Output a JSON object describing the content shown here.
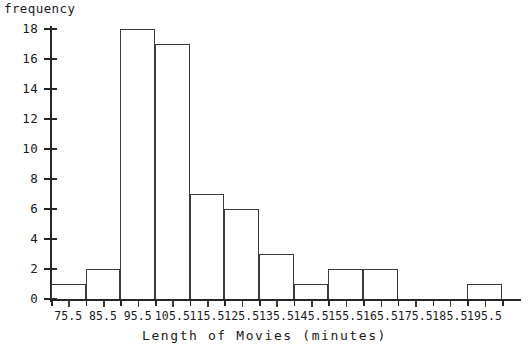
{
  "chart_data": {
    "type": "bar",
    "title": "",
    "xlabel": "Length of Movies (minutes)",
    "ylabel": "frequency",
    "categories": [
      "75.5",
      "85.5",
      "95.5",
      "105.5",
      "115.5",
      "125.5",
      "135.5",
      "145.5",
      "155.5",
      "165.5",
      "175.5",
      "185.5",
      "195.5"
    ],
    "values": [
      1,
      2,
      18,
      17,
      7,
      6,
      3,
      1,
      2,
      2,
      0,
      0,
      1
    ],
    "ylim": [
      0,
      18
    ],
    "ytick_labels": [
      "0",
      "2",
      "4",
      "6",
      "8",
      "10",
      "12",
      "14",
      "16",
      "18"
    ],
    "ytick_values": [
      0,
      2,
      4,
      6,
      8,
      10,
      12,
      14,
      16,
      18
    ],
    "grid": false,
    "legend": null,
    "bin_width": 10,
    "series_color": "#3b3b3b",
    "axis_color": "#262626",
    "background_color": "#ffffff"
  }
}
